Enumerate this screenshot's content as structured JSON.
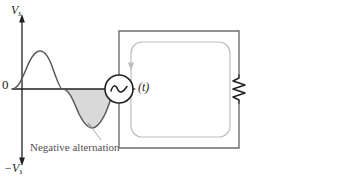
{
  "figure": {
    "panels": [
      {
        "id": "waveform",
        "name": "sine-waveform-plot",
        "axis_y_label_top": "V",
        "axis_y_label_top_sub": "s",
        "axis_y_label_bottom": "−V",
        "axis_y_label_bottom_sub": "s",
        "origin_label": "0",
        "axis_x_label": "(t)",
        "annotation": "Negative alternation",
        "shaded_region_color": "#d9d9d9",
        "curve_color": "#58595b",
        "axis_color": "#231f20",
        "annotation_color": "#555052",
        "leader_color": "#a7a9ac"
      },
      {
        "id": "circuit",
        "name": "ac-source-resistor-circuit",
        "source_label": "V",
        "source_label_sub": "s",
        "source_symbol": "ac-sine-source",
        "terminal_negative": "−",
        "terminal_positive": "+",
        "current_label": "I",
        "current_direction": "clockwise-down-left",
        "resistor_label": "R",
        "wire_color": "#6d6e71",
        "loop_color": "#bcbec0",
        "component_color": "#231f20"
      }
    ]
  }
}
